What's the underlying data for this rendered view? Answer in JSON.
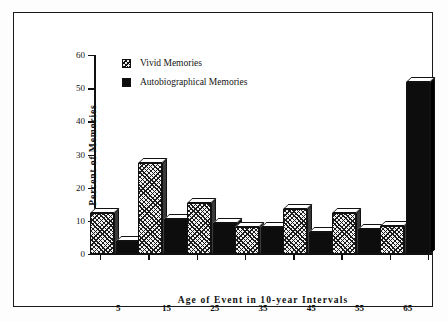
{
  "chart_data": {
    "type": "bar",
    "title": "",
    "subtitle": "",
    "xlabel": "Age of Event in 10-year Intervals",
    "ylabel": "Percent of Memories",
    "categories": [
      "5",
      "15",
      "25",
      "35",
      "45",
      "55",
      "65"
    ],
    "ylim": [
      0,
      60
    ],
    "yticks": [
      0,
      10,
      20,
      30,
      40,
      50,
      60
    ],
    "ytick_labels": [
      "0",
      "10",
      "20",
      "30",
      "40",
      "50",
      "60"
    ],
    "grid": false,
    "legend_position": "top-left",
    "style": "3d-block-bars",
    "series": [
      {
        "name": "Vivid Memories",
        "fill": "diagonal-hatch",
        "color": "#ededed",
        "values": [
          12.5,
          27.5,
          15.5,
          8,
          13.5,
          12.5,
          8.5
        ]
      },
      {
        "name": "Autobiographical Memories",
        "fill": "solid",
        "color": "#0d0d0d",
        "values": [
          4,
          10.5,
          9.5,
          8,
          6.5,
          7.5,
          52
        ]
      }
    ]
  },
  "legend": {
    "items": [
      {
        "label": "Vivid Memories",
        "swatch": "hatched-square-icon"
      },
      {
        "label": "Autobiographical Memories",
        "swatch": "filled-square-icon"
      }
    ]
  },
  "colors": {
    "frame": "#1a1a1a",
    "axis": "#111111",
    "background": "#ffffff",
    "vivid_fill": "#ededed",
    "auto_fill": "#0d0d0d",
    "bar_top_face": "#ffffff"
  }
}
